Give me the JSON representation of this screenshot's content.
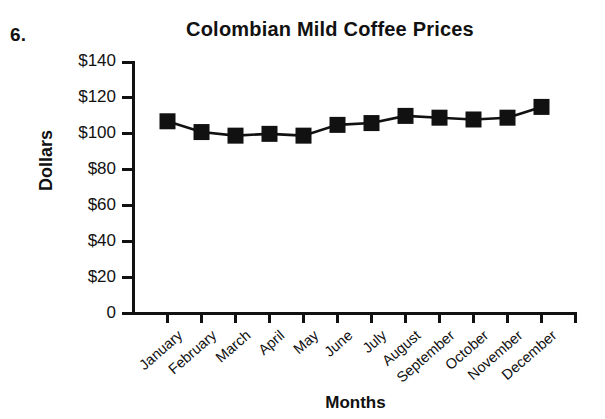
{
  "problem_number": "6.",
  "axis_titles": {
    "x": "Months",
    "y": "Dollars"
  },
  "chart_data": {
    "type": "line",
    "title": "Colombian Mild Coffee Prices",
    "xlabel": "Months",
    "ylabel": "Dollars",
    "categories": [
      "January",
      "February",
      "March",
      "April",
      "May",
      "June",
      "July",
      "August",
      "September",
      "October",
      "November",
      "December"
    ],
    "values": [
      107,
      101,
      99,
      100,
      99,
      105,
      106,
      110,
      109,
      108,
      109,
      115
    ],
    "ytick_labels": [
      "$140",
      "$120",
      "$100",
      "$80",
      "$60",
      "$40",
      "$20",
      "0"
    ],
    "ytick_values": [
      140,
      120,
      100,
      80,
      60,
      40,
      20,
      0
    ],
    "ylim": [
      0,
      140
    ],
    "grid": false,
    "legend": "none",
    "marker": "filled-square",
    "series_color": "#111111"
  }
}
